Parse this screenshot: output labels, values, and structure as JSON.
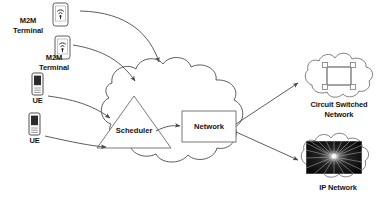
{
  "diagram": {
    "canvas": {
      "width": 389,
      "height": 214
    },
    "colors": {
      "background": "#ffffff",
      "stroke": "#4a4a4a",
      "text": "#141414",
      "device_screen": "#2b2b2b",
      "ip_network_image": "#0d0d0d"
    },
    "endpoints": [
      {
        "id": "m2m1",
        "label_line1": "M2M",
        "label_line2": "Terminal",
        "icon": "smartphone-wifi-icon"
      },
      {
        "id": "m2m2",
        "label_line1": "M2M",
        "label_line2": "Terminal",
        "icon": "smartphone-wifi-icon"
      },
      {
        "id": "ue1",
        "label_line1": "UE",
        "label_line2": "",
        "icon": "feature-phone-icon"
      },
      {
        "id": "ue2",
        "label_line1": "UE",
        "label_line2": "",
        "icon": "feature-phone-icon"
      }
    ],
    "core": {
      "cloud_name": "access-network-cloud",
      "scheduler": {
        "label": "Scheduler",
        "shape": "triangle"
      },
      "network": {
        "label": "Network",
        "shape": "rectangle"
      }
    },
    "destinations": [
      {
        "id": "circuit-switched",
        "label_line1": "Circuit Switched",
        "label_line2": "Network",
        "icon": "ring-topology-icon"
      },
      {
        "id": "ip-network",
        "label_line1": "IP Network",
        "label_line2": "",
        "icon": "radial-burst-image"
      }
    ]
  }
}
